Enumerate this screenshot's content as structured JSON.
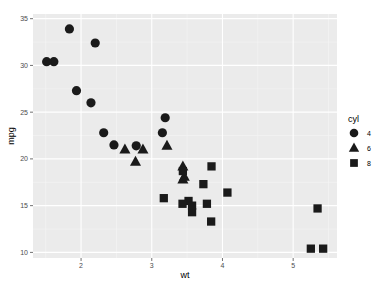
{
  "chart_data": {
    "type": "scatter",
    "title": "",
    "xlabel": "wt",
    "ylabel": "mpg",
    "xlim": [
      1.32,
      5.62
    ],
    "ylim": [
      9.4,
      35.5
    ],
    "xticks": [
      2,
      3,
      4,
      5
    ],
    "yticks": [
      10,
      15,
      20,
      25,
      30,
      35
    ],
    "grid": true,
    "legend": {
      "title": "cyl",
      "position": "right",
      "entries": [
        {
          "label": "4",
          "shape": "circle"
        },
        {
          "label": "6",
          "shape": "triangle"
        },
        {
          "label": "8",
          "shape": "square"
        }
      ]
    },
    "series": [
      {
        "name": "4",
        "shape": "circle",
        "points": [
          [
            2.32,
            22.8
          ],
          [
            3.19,
            24.4
          ],
          [
            3.15,
            22.8
          ],
          [
            2.2,
            32.4
          ],
          [
            1.615,
            30.4
          ],
          [
            1.835,
            33.9
          ],
          [
            2.465,
            21.5
          ],
          [
            1.935,
            27.3
          ],
          [
            2.14,
            26.0
          ],
          [
            1.513,
            30.4
          ],
          [
            2.78,
            21.4
          ]
        ]
      },
      {
        "name": "6",
        "shape": "triangle",
        "points": [
          [
            2.62,
            21.0
          ],
          [
            2.875,
            21.0
          ],
          [
            3.215,
            21.4
          ],
          [
            3.46,
            18.1
          ],
          [
            3.44,
            19.2
          ],
          [
            3.44,
            17.8
          ],
          [
            2.77,
            19.7
          ]
        ]
      },
      {
        "name": "8",
        "shape": "square",
        "points": [
          [
            3.44,
            18.7
          ],
          [
            3.57,
            14.3
          ],
          [
            4.07,
            16.4
          ],
          [
            3.73,
            17.3
          ],
          [
            3.78,
            15.2
          ],
          [
            5.25,
            10.4
          ],
          [
            5.424,
            10.4
          ],
          [
            5.345,
            14.7
          ],
          [
            3.52,
            15.5
          ],
          [
            3.435,
            15.2
          ],
          [
            3.84,
            13.3
          ],
          [
            3.845,
            19.2
          ],
          [
            3.17,
            15.8
          ],
          [
            3.57,
            15.0
          ]
        ]
      }
    ]
  },
  "colors": {
    "panel_bg": "#ebebeb",
    "grid_major": "#ffffff",
    "grid_minor": "#f5f5f5",
    "point": "#1a1a1a"
  }
}
